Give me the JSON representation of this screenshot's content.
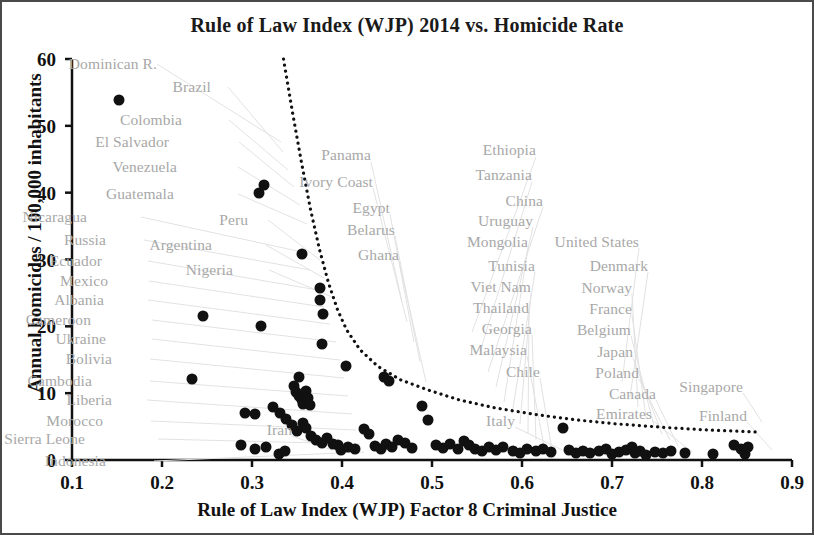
{
  "chart_data": {
    "type": "scatter",
    "title": "Rule of Law Index (WJP) 2014 vs. Homicide Rate",
    "xlabel": "Rule of Law Index (WJP) Factor 8 Criminal Justice",
    "ylabel": "Annual homicides / 100,000 inhabitants",
    "xlim": [
      0.1,
      0.9
    ],
    "ylim": [
      0,
      60
    ],
    "xticks": [
      0.1,
      0.2,
      0.3,
      0.4,
      0.5,
      0.6,
      0.7,
      0.8,
      0.9
    ],
    "xtick_labels": [
      "0.1",
      "0.2",
      "0.3",
      "0.4",
      "0.5",
      "0.6",
      "0.7",
      "0.8",
      "0.9"
    ],
    "yticks": [
      0,
      10,
      20,
      30,
      40,
      50,
      60
    ],
    "ytick_labels": [
      "0",
      "10",
      "20",
      "30",
      "40",
      "50",
      "60"
    ],
    "grid": false,
    "legend": "none",
    "marker_color": "#111111",
    "label_color": "#a8a8a8",
    "trend": {
      "style": "dotted",
      "color": "#111111",
      "description": "dotted decreasing power-law style envelope curve",
      "points": [
        [
          0.335,
          60.0
        ],
        [
          0.345,
          52.0
        ],
        [
          0.355,
          44.5
        ],
        [
          0.365,
          37.5
        ],
        [
          0.375,
          31.5
        ],
        [
          0.385,
          26.5
        ],
        [
          0.395,
          22.5
        ],
        [
          0.405,
          19.5
        ],
        [
          0.42,
          16.5
        ],
        [
          0.44,
          14.0
        ],
        [
          0.465,
          12.0
        ],
        [
          0.495,
          10.5
        ],
        [
          0.53,
          9.0
        ],
        [
          0.57,
          7.8
        ],
        [
          0.615,
          6.8
        ],
        [
          0.66,
          6.0
        ],
        [
          0.705,
          5.4
        ],
        [
          0.755,
          4.9
        ],
        [
          0.805,
          4.5
        ],
        [
          0.86,
          4.2
        ]
      ]
    },
    "points": [
      {
        "x": 0.152,
        "y": 53.9
      },
      {
        "x": 0.313,
        "y": 41.2
      },
      {
        "x": 0.308,
        "y": 39.9
      },
      {
        "x": 0.356,
        "y": 30.8
      },
      {
        "x": 0.376,
        "y": 25.8
      },
      {
        "x": 0.376,
        "y": 23.9
      },
      {
        "x": 0.245,
        "y": 21.5
      },
      {
        "x": 0.31,
        "y": 20.1
      },
      {
        "x": 0.379,
        "y": 21.9
      },
      {
        "x": 0.378,
        "y": 17.3
      },
      {
        "x": 0.404,
        "y": 14.0
      },
      {
        "x": 0.233,
        "y": 12.1
      },
      {
        "x": 0.352,
        "y": 12.4
      },
      {
        "x": 0.347,
        "y": 11.1
      },
      {
        "x": 0.349,
        "y": 10.2
      },
      {
        "x": 0.352,
        "y": 9.6
      },
      {
        "x": 0.355,
        "y": 9.0
      },
      {
        "x": 0.357,
        "y": 8.4
      },
      {
        "x": 0.36,
        "y": 10.3
      },
      {
        "x": 0.362,
        "y": 9.3
      },
      {
        "x": 0.364,
        "y": 8.2
      },
      {
        "x": 0.447,
        "y": 12.4
      },
      {
        "x": 0.452,
        "y": 11.8
      },
      {
        "x": 0.292,
        "y": 7.0
      },
      {
        "x": 0.303,
        "y": 6.9
      },
      {
        "x": 0.323,
        "y": 7.9
      },
      {
        "x": 0.331,
        "y": 7.1
      },
      {
        "x": 0.338,
        "y": 6.2
      },
      {
        "x": 0.344,
        "y": 5.2
      },
      {
        "x": 0.35,
        "y": 4.3
      },
      {
        "x": 0.357,
        "y": 5.6
      },
      {
        "x": 0.36,
        "y": 4.8
      },
      {
        "x": 0.366,
        "y": 3.6
      },
      {
        "x": 0.371,
        "y": 3.0
      },
      {
        "x": 0.378,
        "y": 2.6
      },
      {
        "x": 0.383,
        "y": 3.3
      },
      {
        "x": 0.39,
        "y": 2.4
      },
      {
        "x": 0.396,
        "y": 2.2
      },
      {
        "x": 0.399,
        "y": 1.5
      },
      {
        "x": 0.407,
        "y": 2.0
      },
      {
        "x": 0.414,
        "y": 1.6
      },
      {
        "x": 0.288,
        "y": 2.3
      },
      {
        "x": 0.303,
        "y": 1.6
      },
      {
        "x": 0.316,
        "y": 1.9
      },
      {
        "x": 0.33,
        "y": 0.9
      },
      {
        "x": 0.337,
        "y": 1.4
      },
      {
        "x": 0.424,
        "y": 4.6
      },
      {
        "x": 0.43,
        "y": 3.9
      },
      {
        "x": 0.437,
        "y": 2.1
      },
      {
        "x": 0.443,
        "y": 1.7
      },
      {
        "x": 0.449,
        "y": 2.4
      },
      {
        "x": 0.455,
        "y": 1.9
      },
      {
        "x": 0.462,
        "y": 3.0
      },
      {
        "x": 0.47,
        "y": 2.6
      },
      {
        "x": 0.478,
        "y": 1.8
      },
      {
        "x": 0.489,
        "y": 8.1
      },
      {
        "x": 0.496,
        "y": 6.0
      },
      {
        "x": 0.504,
        "y": 2.2
      },
      {
        "x": 0.512,
        "y": 1.8
      },
      {
        "x": 0.52,
        "y": 2.4
      },
      {
        "x": 0.529,
        "y": 1.6
      },
      {
        "x": 0.535,
        "y": 2.9
      },
      {
        "x": 0.541,
        "y": 2.2
      },
      {
        "x": 0.548,
        "y": 1.7
      },
      {
        "x": 0.556,
        "y": 1.3
      },
      {
        "x": 0.563,
        "y": 2.0
      },
      {
        "x": 0.571,
        "y": 1.5
      },
      {
        "x": 0.579,
        "y": 1.9
      },
      {
        "x": 0.59,
        "y": 1.4
      },
      {
        "x": 0.598,
        "y": 1.1
      },
      {
        "x": 0.606,
        "y": 1.7
      },
      {
        "x": 0.615,
        "y": 1.3
      },
      {
        "x": 0.623,
        "y": 1.6
      },
      {
        "x": 0.632,
        "y": 1.2
      },
      {
        "x": 0.645,
        "y": 4.8
      },
      {
        "x": 0.652,
        "y": 1.5
      },
      {
        "x": 0.66,
        "y": 1.1
      },
      {
        "x": 0.668,
        "y": 1.4
      },
      {
        "x": 0.676,
        "y": 1.0
      },
      {
        "x": 0.685,
        "y": 1.3
      },
      {
        "x": 0.693,
        "y": 1.6
      },
      {
        "x": 0.7,
        "y": 0.9
      },
      {
        "x": 0.708,
        "y": 1.2
      },
      {
        "x": 0.716,
        "y": 1.5
      },
      {
        "x": 0.722,
        "y": 2.0
      },
      {
        "x": 0.726,
        "y": 1.1
      },
      {
        "x": 0.731,
        "y": 1.4
      },
      {
        "x": 0.738,
        "y": 0.8
      },
      {
        "x": 0.748,
        "y": 1.2
      },
      {
        "x": 0.757,
        "y": 1.0
      },
      {
        "x": 0.766,
        "y": 1.3
      },
      {
        "x": 0.781,
        "y": 1.1
      },
      {
        "x": 0.812,
        "y": 0.9
      },
      {
        "x": 0.836,
        "y": 2.3
      },
      {
        "x": 0.843,
        "y": 1.7
      },
      {
        "x": 0.848,
        "y": 0.9
      },
      {
        "x": 0.851,
        "y": 1.9
      }
    ],
    "annotations": [
      {
        "text": "Dominican R.",
        "x": 0.1,
        "y": 58.6,
        "align": "left",
        "px": 155,
        "py": 62
      },
      {
        "text": "Brazil",
        "x": 0.1,
        "y": 55.5,
        "align": "left",
        "px": 209,
        "py": 85
      },
      {
        "text": "Colombia",
        "x": 0.1,
        "y": 51.3,
        "align": "left",
        "px": 180,
        "py": 118
      },
      {
        "text": "El Salvador",
        "x": 0.1,
        "y": 48.5,
        "align": "left",
        "px": 167,
        "py": 140
      },
      {
        "text": "Venezuela",
        "x": 0.1,
        "y": 45.4,
        "align": "left",
        "px": 175,
        "py": 165
      },
      {
        "text": "Guatemala",
        "x": 0.1,
        "y": 41.9,
        "align": "left",
        "px": 172,
        "py": 192
      },
      {
        "text": "Nicaragua",
        "x": 0.1,
        "y": 37.9,
        "align": "left",
        "px": 85,
        "py": 215
      },
      {
        "text": "Peru",
        "x": 0.1,
        "y": 36.0,
        "align": "left",
        "px": 246,
        "py": 218
      },
      {
        "text": "Russia",
        "x": 0.1,
        "y": 34.8,
        "align": "left",
        "px": 104,
        "py": 238
      },
      {
        "text": "Argentina",
        "x": 0.1,
        "y": 33.8,
        "align": "left",
        "px": 210,
        "py": 243
      },
      {
        "text": "Ecuador",
        "x": 0.1,
        "y": 31.6,
        "align": "left",
        "px": 100,
        "py": 259
      },
      {
        "text": "Nigeria",
        "x": 0.1,
        "y": 30.0,
        "align": "left",
        "px": 231,
        "py": 268
      },
      {
        "text": "Mexico",
        "x": 0.1,
        "y": 28.7,
        "align": "left",
        "px": 106,
        "py": 279
      },
      {
        "text": "Albania",
        "x": 0.1,
        "y": 25.9,
        "align": "left",
        "px": 102,
        "py": 298
      },
      {
        "text": "Cameroon",
        "x": 0.1,
        "y": 23.3,
        "align": "left",
        "px": 89,
        "py": 318
      },
      {
        "text": "Ukraine",
        "x": 0.1,
        "y": 20.7,
        "align": "left",
        "px": 104,
        "py": 337
      },
      {
        "text": "Bolivia",
        "x": 0.1,
        "y": 18.3,
        "align": "left",
        "px": 110,
        "py": 357
      },
      {
        "text": "Cambodia",
        "x": 0.1,
        "y": 15.6,
        "align": "left",
        "px": 90,
        "py": 379
      },
      {
        "text": "Liberia",
        "x": 0.1,
        "y": 13.0,
        "align": "left",
        "px": 110,
        "py": 398
      },
      {
        "text": "Morocco",
        "x": 0.1,
        "y": 10.7,
        "align": "left",
        "px": 101,
        "py": 419
      },
      {
        "text": "Sierra Leone",
        "x": 0.1,
        "y": 8.4,
        "align": "left",
        "px": 83,
        "py": 437
      },
      {
        "text": "Indonesia",
        "x": 0.1,
        "y": 4.5,
        "align": "left",
        "px": 104,
        "py": 459
      },
      {
        "text": "Panama",
        "x": 0.1,
        "y": 45.8,
        "align": "left",
        "px": 369,
        "py": 153
      },
      {
        "text": "Ivory Coast",
        "x": 0.1,
        "y": 42.9,
        "align": "left",
        "px": 371,
        "py": 180
      },
      {
        "text": "Egypt",
        "x": 0.1,
        "y": 39.5,
        "align": "left",
        "px": 388,
        "py": 206
      },
      {
        "text": "Belarus",
        "x": 0.1,
        "y": 36.6,
        "align": "left",
        "px": 393,
        "py": 228
      },
      {
        "text": "Ghana",
        "x": 0.1,
        "y": 33.5,
        "align": "left",
        "px": 397,
        "py": 253
      },
      {
        "text": "Ethiopia",
        "x": 0.1,
        "y": 46.6,
        "align": "left",
        "px": 534,
        "py": 148
      },
      {
        "text": "Tanzania",
        "x": 0.1,
        "y": 43.4,
        "align": "left",
        "px": 530,
        "py": 173
      },
      {
        "text": "China",
        "x": 0.1,
        "y": 40.2,
        "align": "left",
        "px": 541,
        "py": 199
      },
      {
        "text": "Uruguay",
        "x": 0.1,
        "y": 37.7,
        "align": "left",
        "px": 531,
        "py": 219
      },
      {
        "text": "Mongolia",
        "x": 0.1,
        "y": 35.0,
        "align": "left",
        "px": 526,
        "py": 240
      },
      {
        "text": "Tunisia",
        "x": 0.1,
        "y": 31.9,
        "align": "left",
        "px": 533,
        "py": 264
      },
      {
        "text": "Viet Nam",
        "x": 0.1,
        "y": 29.2,
        "align": "left",
        "px": 529,
        "py": 285
      },
      {
        "text": "Thailand",
        "x": 0.1,
        "y": 26.6,
        "align": "left",
        "px": 527,
        "py": 306
      },
      {
        "text": "Georgia",
        "x": 0.1,
        "y": 23.8,
        "align": "left",
        "px": 530,
        "py": 327
      },
      {
        "text": "Malaysia",
        "x": 0.1,
        "y": 21.1,
        "align": "left",
        "px": 525,
        "py": 348
      },
      {
        "text": "Chile",
        "x": 0.1,
        "y": 18.3,
        "align": "left",
        "px": 538,
        "py": 370
      },
      {
        "text": "United States",
        "x": 0.1,
        "y": 34.8,
        "align": "left",
        "px": 637,
        "py": 240
      },
      {
        "text": "Denmark",
        "x": 0.1,
        "y": 31.9,
        "align": "left",
        "px": 646,
        "py": 264
      },
      {
        "text": "Norway",
        "x": 0.1,
        "y": 29.2,
        "align": "left",
        "px": 630,
        "py": 286
      },
      {
        "text": "France",
        "x": 0.1,
        "y": 26.4,
        "align": "left",
        "px": 630,
        "py": 307
      },
      {
        "text": "Belgium",
        "x": 0.1,
        "y": 23.6,
        "align": "left",
        "px": 629,
        "py": 328
      },
      {
        "text": "Japan",
        "x": 0.1,
        "y": 20.9,
        "align": "left",
        "px": 631,
        "py": 350
      },
      {
        "text": "Poland",
        "x": 0.1,
        "y": 18.1,
        "align": "left",
        "px": 637,
        "py": 371
      },
      {
        "text": "Canada",
        "x": 0.1,
        "y": 15.5,
        "align": "left",
        "px": 654,
        "py": 392
      },
      {
        "text": "Emirates",
        "x": 0.1,
        "y": 12.9,
        "align": "left",
        "px": 650,
        "py": 412
      },
      {
        "text": "Singapore",
        "x": 0.1,
        "y": 14.5,
        "align": "left",
        "px": 741,
        "py": 385
      },
      {
        "text": "Finland",
        "x": 0.1,
        "y": 11.5,
        "align": "left",
        "px": 745,
        "py": 414
      },
      {
        "text": "Italy",
        "x": 0.1,
        "y": 8.5,
        "align": "left",
        "px": 513,
        "py": 419
      },
      {
        "text": "Iran",
        "x": 0.1,
        "y": 5.0,
        "align": "left",
        "px": 290,
        "py": 428
      }
    ],
    "leader_lines": [
      [
        155,
        62,
        279,
        140
      ],
      [
        226,
        85,
        281,
        150
      ],
      [
        227,
        118,
        286,
        168
      ],
      [
        237,
        140,
        292,
        185
      ],
      [
        236,
        165,
        298,
        203
      ],
      [
        236,
        192,
        305,
        222
      ],
      [
        139,
        215,
        300,
        250
      ],
      [
        266,
        218,
        318,
        258
      ],
      [
        142,
        238,
        308,
        268
      ],
      [
        264,
        243,
        322,
        276
      ],
      [
        146,
        259,
        316,
        288
      ],
      [
        267,
        268,
        330,
        295
      ],
      [
        147,
        279,
        322,
        305
      ],
      [
        146,
        298,
        328,
        322
      ],
      [
        150,
        318,
        334,
        340
      ],
      [
        150,
        337,
        338,
        358
      ],
      [
        148,
        357,
        342,
        376
      ],
      [
        148,
        379,
        346,
        394
      ],
      [
        145,
        398,
        350,
        412
      ],
      [
        149,
        419,
        354,
        428
      ],
      [
        156,
        437,
        358,
        442
      ],
      [
        152,
        459,
        362,
        450
      ],
      [
        369,
        160,
        400,
        300
      ],
      [
        371,
        186,
        405,
        320
      ],
      [
        388,
        212,
        412,
        340
      ],
      [
        393,
        234,
        418,
        360
      ],
      [
        397,
        259,
        424,
        380
      ],
      [
        534,
        155,
        470,
        330
      ],
      [
        530,
        180,
        478,
        350
      ],
      [
        541,
        205,
        486,
        370
      ],
      [
        531,
        225,
        494,
        385
      ],
      [
        526,
        246,
        502,
        400
      ],
      [
        533,
        270,
        510,
        412
      ],
      [
        529,
        291,
        518,
        422
      ],
      [
        527,
        312,
        526,
        432
      ],
      [
        530,
        333,
        534,
        438
      ],
      [
        525,
        354,
        542,
        444
      ],
      [
        538,
        376,
        550,
        448
      ],
      [
        637,
        246,
        620,
        380
      ],
      [
        646,
        270,
        628,
        395
      ],
      [
        630,
        292,
        636,
        405
      ],
      [
        630,
        313,
        644,
        415
      ],
      [
        629,
        334,
        652,
        424
      ],
      [
        631,
        356,
        660,
        432
      ],
      [
        637,
        377,
        668,
        438
      ],
      [
        654,
        398,
        676,
        444
      ],
      [
        650,
        418,
        690,
        450
      ],
      [
        741,
        391,
        760,
        420
      ],
      [
        745,
        420,
        770,
        448
      ],
      [
        513,
        425,
        560,
        448
      ],
      [
        290,
        434,
        330,
        448
      ]
    ]
  }
}
